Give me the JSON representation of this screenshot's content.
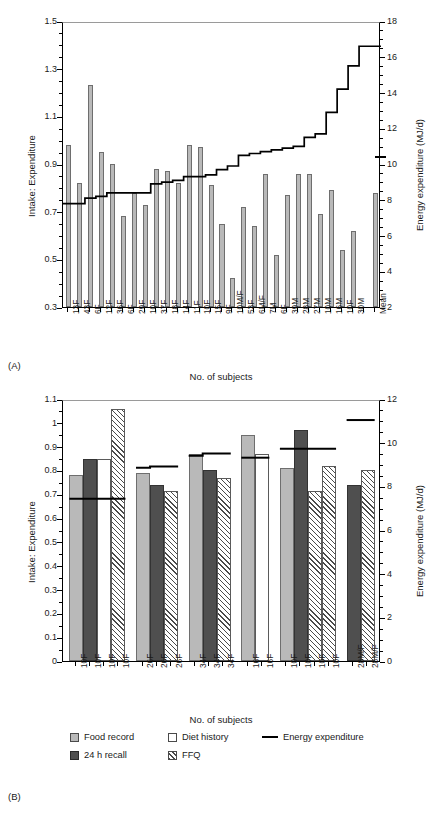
{
  "figure": {
    "panel_a_letter": "(A)",
    "panel_b_letter": "(B)"
  },
  "legend": {
    "items": [
      {
        "key": "food",
        "label": "Food record"
      },
      {
        "key": "recall",
        "label": "24 h recall"
      },
      {
        "key": "diet",
        "label": "Diet history"
      },
      {
        "key": "ffq",
        "label": "FFQ"
      },
      {
        "key": "line",
        "label": "Energy expenditure"
      }
    ]
  },
  "chart_data": [
    {
      "id": "panel-a",
      "type": "bar",
      "title": "",
      "xlabel": "No. of subjects",
      "ylabel": "Intake: Expenditure",
      "ylabel_right": "Energy expenditure (MJ/d)",
      "ylim": [
        0.3,
        1.5
      ],
      "yticks": [
        0.3,
        0.5,
        0.7,
        0.9,
        1.1,
        1.3,
        1.5
      ],
      "ylim_right": [
        2,
        18
      ],
      "yticks_right": [
        2,
        4,
        6,
        8,
        10,
        12,
        14,
        16,
        18
      ],
      "grid": false,
      "legend_position": "none",
      "categories": [
        "13F",
        "43F",
        "6F",
        "12F",
        "36F",
        "6F",
        "29F",
        "10F",
        "37F",
        "18F",
        "14F",
        "11F",
        "10F",
        "15F",
        "9F",
        "10M/F",
        "53F",
        "6M/F",
        "7M",
        "6F",
        "39M",
        "28M",
        "27M",
        "10M",
        "16M",
        "10F",
        "30M",
        "",
        "Mean"
      ],
      "values": [
        0.98,
        0.82,
        1.23,
        0.95,
        0.9,
        0.68,
        0.78,
        0.73,
        0.88,
        0.87,
        0.82,
        0.98,
        0.97,
        0.81,
        0.65,
        0.42,
        0.72,
        0.64,
        0.86,
        0.52,
        0.77,
        0.86,
        0.86,
        0.69,
        0.79,
        0.54,
        0.62,
        null,
        0.78
      ],
      "energy_expenditure_step": [
        7.9,
        7.9,
        8.2,
        8.3,
        8.5,
        8.5,
        8.5,
        8.5,
        9.0,
        9.1,
        9.2,
        9.4,
        9.4,
        9.5,
        9.8,
        10.0,
        10.6,
        10.7,
        10.8,
        10.9,
        11.0,
        11.1,
        11.6,
        11.8,
        13.0,
        14.3,
        15.6,
        16.7,
        16.7
      ],
      "mean_marker_right": 10.5,
      "series_note": "bars = intake:expenditure ratio, step line = energy expenditure (right axis)"
    },
    {
      "id": "panel-b",
      "type": "bar",
      "title": "",
      "xlabel": "No. of subjects",
      "ylabel": "Intake: Expenditure",
      "ylabel_right": "Energy expenditure (MJ/d)",
      "ylim": [
        0,
        1.1
      ],
      "yticks": [
        0,
        0.1,
        0.2,
        0.3,
        0.4,
        0.5,
        0.6,
        0.7,
        0.8,
        0.9,
        1,
        1.1
      ],
      "ylim_right": [
        0,
        12
      ],
      "yticks_right": [
        0,
        2,
        4,
        6,
        8,
        10,
        12
      ],
      "grid": false,
      "legend_position": "bottom",
      "categories": [
        "10F",
        "10F",
        "10F",
        "10F",
        "26F",
        "26F",
        "26F",
        "34F",
        "34F",
        "34F",
        "16F",
        "16F",
        "10F",
        "10F",
        "10F",
        "10F",
        "28M/F",
        "28M/F"
      ],
      "methods": [
        "food",
        "recall",
        "diet",
        "ffq",
        "food",
        "recall",
        "ffq",
        "food",
        "recall",
        "ffq",
        "food",
        "diet",
        "food",
        "recall",
        "ffq",
        "ffq",
        "recall",
        "ffq"
      ],
      "values": [
        0.78,
        0.85,
        0.85,
        1.06,
        0.79,
        0.74,
        0.715,
        0.87,
        0.8,
        0.77,
        0.95,
        0.87,
        0.81,
        0.97,
        0.715,
        0.82,
        0.74,
        0.8
      ],
      "groups": [
        {
          "label": "10F",
          "n_bars": 4,
          "energy_expenditure_levels": [
            0.69,
            0.69,
            0.69,
            0.69
          ]
        },
        {
          "label": "26F",
          "n_bars": 3,
          "energy_expenditure_levels": [
            0.82,
            0.825,
            0.825
          ]
        },
        {
          "label": "34F",
          "n_bars": 3,
          "energy_expenditure_levels": [
            0.87,
            0.88,
            0.88
          ]
        },
        {
          "label": "16F",
          "n_bars": 2,
          "energy_expenditure_levels": [
            0.862,
            0.862
          ]
        },
        {
          "label": "10F",
          "n_bars": 4,
          "energy_expenditure_levels": [
            0.9,
            0.9,
            0.9,
            0.9
          ]
        },
        {
          "label": "28M/F",
          "n_bars": 2,
          "energy_expenditure_levels": [
            1.02,
            1.02
          ]
        }
      ],
      "series_note": "grouped bars by dietary assessment method; horizontal black rules = measured energy expenditure per group"
    }
  ]
}
